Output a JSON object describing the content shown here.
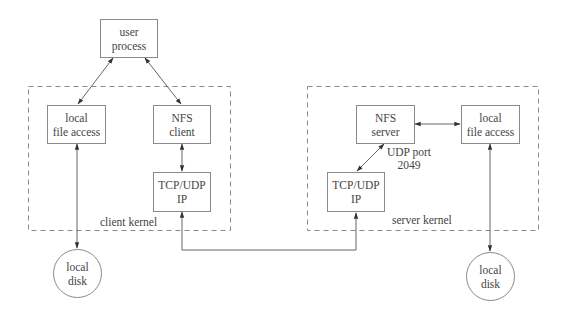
{
  "diagram": {
    "colors": {
      "stroke": "#8a8a8a",
      "dashed": "#8a8a8a",
      "text": "#444444",
      "background": "#ffffff"
    },
    "nodes": {
      "user_process": {
        "line1": "user",
        "line2": "process"
      },
      "client_local_file_access": {
        "line1": "local",
        "line2": "file access"
      },
      "nfs_client": {
        "line1": "NFS",
        "line2": "client"
      },
      "client_tcp_udp": {
        "line1": "TCP/UDP",
        "line2": "IP"
      },
      "client_local_disk": {
        "line1": "local",
        "line2": "disk"
      },
      "nfs_server": {
        "line1": "NFS",
        "line2": "server"
      },
      "server_local_file_access": {
        "line1": "local",
        "line2": "file access"
      },
      "server_tcp_udp": {
        "line1": "TCP/UDP",
        "line2": "IP"
      },
      "server_local_disk": {
        "line1": "local",
        "line2": "disk"
      }
    },
    "groups": {
      "client_kernel": {
        "label": "client kernel"
      },
      "server_kernel": {
        "label": "server kernel"
      }
    },
    "annotations": {
      "udp_port": {
        "line1": "UDP port",
        "line2": "2049"
      }
    },
    "edges": [
      {
        "from": "user process",
        "to": "local file access (client)",
        "type": "bidirectional"
      },
      {
        "from": "user process",
        "to": "NFS client",
        "type": "bidirectional"
      },
      {
        "from": "NFS client",
        "to": "TCP/UDP IP (client)",
        "type": "bidirectional"
      },
      {
        "from": "local file access (client)",
        "to": "local disk (client)",
        "type": "bidirectional"
      },
      {
        "from": "TCP/UDP IP (client)",
        "to": "TCP/UDP IP (server)",
        "type": "bidirectional"
      },
      {
        "from": "TCP/UDP IP (server)",
        "to": "NFS server",
        "type": "bidirectional",
        "label": "UDP port 2049"
      },
      {
        "from": "NFS server",
        "to": "local file access (server)",
        "type": "bidirectional"
      },
      {
        "from": "local file access (server)",
        "to": "local disk (server)",
        "type": "bidirectional"
      }
    ]
  }
}
